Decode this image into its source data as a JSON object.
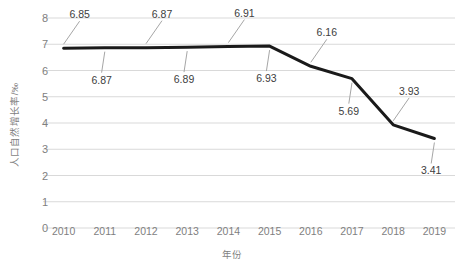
{
  "chart_data": {
    "type": "line",
    "title": "",
    "subtitle": "",
    "xlabel": "年份",
    "ylabel": "人口自然增长率/‰",
    "categories": [
      "2010",
      "2011",
      "2012",
      "2013",
      "2014",
      "2015",
      "2016",
      "2017",
      "2018",
      "2019"
    ],
    "values": [
      6.85,
      6.87,
      6.87,
      6.89,
      6.91,
      6.93,
      6.16,
      5.69,
      3.93,
      3.41
    ],
    "data_labels": [
      "6.85",
      "6.87",
      "6.87",
      "6.89",
      "6.91",
      "6.93",
      "6.16",
      "5.69",
      "3.93",
      "3.41"
    ],
    "data_label_positions": [
      "above",
      "below",
      "above",
      "below",
      "above",
      "below",
      "above",
      "below",
      "above",
      "below"
    ],
    "series": [
      {
        "name": "人口自然增长率",
        "values": [
          6.85,
          6.87,
          6.87,
          6.89,
          6.91,
          6.93,
          6.16,
          5.69,
          3.93,
          3.41
        ],
        "color": "#1a1a1a"
      }
    ],
    "ylim": [
      0,
      8
    ],
    "yticks": [
      "0",
      "1",
      "2",
      "3",
      "4",
      "5",
      "6",
      "7",
      "8"
    ],
    "ytick_step": 1,
    "grid": true,
    "grid_axis": "y",
    "legend": false,
    "legend_position": "none",
    "colors": {
      "line": "#1a1a1a",
      "gridline": "#d9d9d9",
      "tick_text": "#7f7f7f",
      "axis_title_text": "#7f7f7f",
      "data_label_text": "#404040",
      "leader_line": "#a6a6a6",
      "background": "#ffffff"
    }
  }
}
